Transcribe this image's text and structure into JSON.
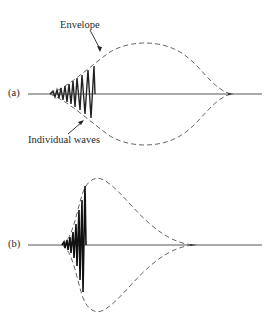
{
  "panels": [
    {
      "id": "a",
      "label": "(a)",
      "annotations": {
        "envelope": "Envelope",
        "individual_waves": "Individual waves"
      }
    },
    {
      "id": "b",
      "label": "(b)"
    }
  ],
  "colors": {
    "line": "#2a2a2a",
    "envelope": "#666666",
    "background": "#ffffff"
  }
}
